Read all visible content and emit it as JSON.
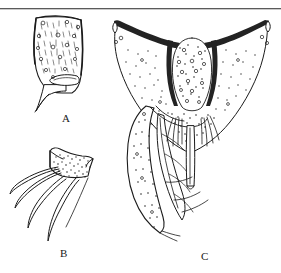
{
  "plate": {
    "background_color": "#ffffff",
    "ink_color": "#1b1b1b",
    "header_rule": {
      "name": "page-header-rule",
      "color": "#5a5a5a",
      "thickness_px": 1,
      "y_px": 8
    },
    "header_ghost_left": "",
    "header_ghost_right": "",
    "figures": [
      {
        "id": "A",
        "label": "A",
        "label_x": 62,
        "label_y": 118,
        "caption": "",
        "description": "elongate stippled sclerite with setal sockets and a basal hook process"
      },
      {
        "id": "B",
        "label": "B",
        "label_x": 60,
        "label_y": 252,
        "caption": "",
        "description": "stippled apical cap bearing four long curved setae"
      },
      {
        "id": "C",
        "label": "C",
        "label_x": 203,
        "label_y": 256,
        "caption": "",
        "description": "broad V-shaped sclerite with dark upper margin, median stippled oval, lateral lobes and paired setal tufts with median rod"
      }
    ]
  }
}
